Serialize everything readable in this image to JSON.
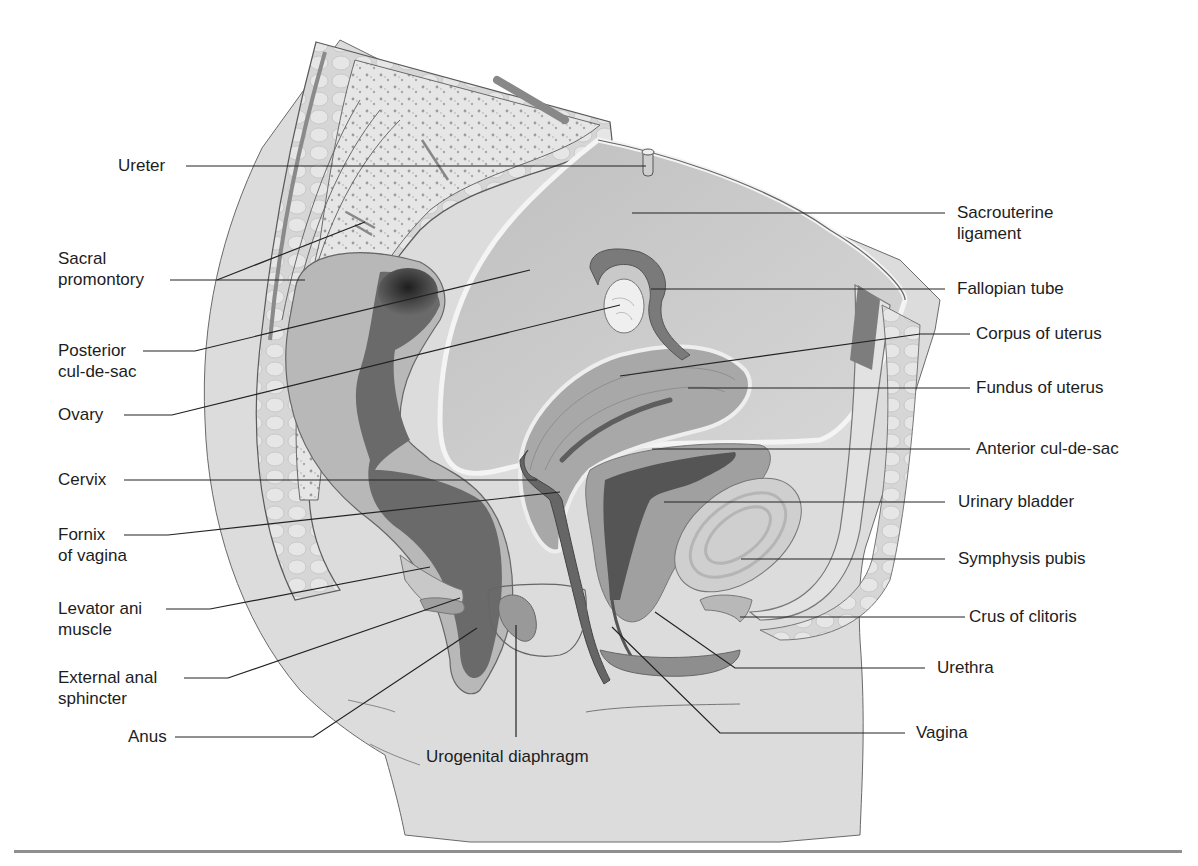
{
  "figure": {
    "type": "anatomical sagittal section",
    "colors": {
      "background": "#ffffff",
      "skin": "#d9d9d9",
      "tissue": "#c4c4c4",
      "bone": "#e4e4e4",
      "bone_dots": "#9a9a9a",
      "organ_mid": "#8a8a8a",
      "organ_dark": "#5a5a5a",
      "rectum_dark": "#2e2e2e",
      "outline": "#555555",
      "label_text": "#1d1d1d",
      "leader_line": "#222222",
      "rule": "#8f8f8f"
    }
  },
  "labels": {
    "left": [
      {
        "id": "ureter",
        "text": "Ureter"
      },
      {
        "id": "sacral_promontory",
        "text": "Sacral",
        "text2": "promontory"
      },
      {
        "id": "posterior_cul_de_sac",
        "text": "Posterior",
        "text2": "cul-de-sac"
      },
      {
        "id": "ovary",
        "text": "Ovary"
      },
      {
        "id": "cervix",
        "text": "Cervix"
      },
      {
        "id": "fornix_of_vagina",
        "text": "Fornix",
        "text2": "of vagina"
      },
      {
        "id": "levator_ani_muscle",
        "text": "Levator ani",
        "text2": "muscle"
      },
      {
        "id": "external_anal_sphincter",
        "text": "External anal",
        "text2": "sphincter"
      },
      {
        "id": "anus",
        "text": "Anus"
      }
    ],
    "right": [
      {
        "id": "sacrouterine_ligament",
        "text": "Sacrouterine",
        "text2": "ligament"
      },
      {
        "id": "fallopian_tube",
        "text": "Fallopian tube"
      },
      {
        "id": "corpus_of_uterus",
        "text": "Corpus of uterus"
      },
      {
        "id": "fundus_of_uterus",
        "text": "Fundus of uterus"
      },
      {
        "id": "anterior_cul_de_sac",
        "text": "Anterior cul-de-sac"
      },
      {
        "id": "urinary_bladder",
        "text": "Urinary bladder"
      },
      {
        "id": "symphysis_pubis",
        "text": "Symphysis pubis"
      },
      {
        "id": "crus_of_clitoris",
        "text": "Crus of clitoris"
      },
      {
        "id": "urethra",
        "text": "Urethra"
      },
      {
        "id": "vagina",
        "text": "Vagina"
      }
    ],
    "bottom": [
      {
        "id": "urogenital_diaphragm",
        "text": "Urogenital diaphragm"
      }
    ]
  }
}
